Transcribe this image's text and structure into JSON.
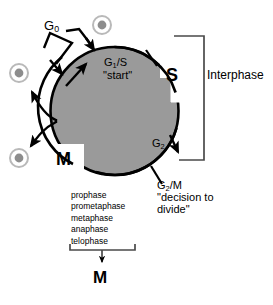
{
  "diagram": {
    "colors": {
      "disc_fill": "#9a9a9a",
      "outline": "#000000",
      "bracket": "#4a4a4a",
      "cell_ring": "#b9b9b9",
      "cell_nucleus": "#8d8d8d",
      "background": "#ffffff"
    },
    "cycle_labels": {
      "g0": "G",
      "g0_sub": "0",
      "g1s": "G",
      "g1s_sub": "1",
      "g1s_rest": "/S",
      "start": "\"start\"",
      "s_phase": "S",
      "m_phase": "M",
      "g2": "G",
      "g2_sub": "2",
      "g2m": "G",
      "g2m_sub": "2",
      "g2m_rest": "/M",
      "decision_line1": "\"decision to",
      "decision_line2": "divide\"",
      "interphase": "Interphase"
    },
    "mitosis_phases": [
      "prophase",
      "prometaphase",
      "metaphase",
      "anaphase",
      "telophase"
    ],
    "mitosis_bracket_label": "M",
    "cells": [
      {
        "name": "quiescent-cell-g0",
        "cx": 102,
        "cy": 25
      },
      {
        "name": "daughter-cell-upper",
        "cx": 19,
        "cy": 73
      },
      {
        "name": "daughter-cell-lower",
        "cx": 19,
        "cy": 158
      }
    ],
    "icons": {
      "cell": "cell-icon",
      "arrow": "arrow-icon",
      "checkpoint_tick": "checkpoint-tick-icon",
      "bracket": "bracket-icon"
    }
  }
}
